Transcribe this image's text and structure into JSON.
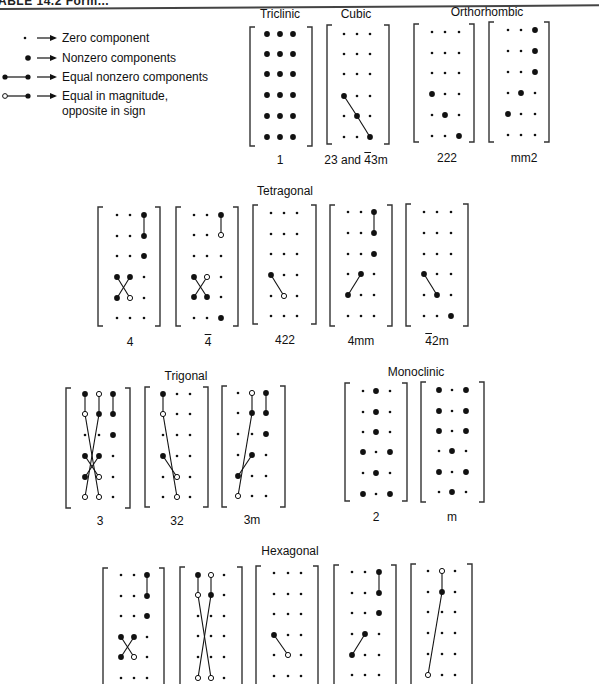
{
  "header": {
    "title": "ABLE 14.2 Form..."
  },
  "legend": [
    {
      "symbol": "zero-dot",
      "text": "Zero component"
    },
    {
      "symbol": "nonzero-dot",
      "text": "Nonzero components"
    },
    {
      "symbol": "equal-pair",
      "text": "Equal nonzero components"
    },
    {
      "symbol": "opposite-pair",
      "text": "Equal in magnitude,",
      "text2": "opposite in sign"
    }
  ],
  "groups": [
    {
      "name": "Triclinic",
      "x": 280,
      "y": 7
    },
    {
      "name": "Cubic",
      "x": 356,
      "y": 7
    },
    {
      "name": "Orthorhombic",
      "x": 487,
      "y": 5
    },
    {
      "name": "Tetragonal",
      "x": 285,
      "y": 184
    },
    {
      "name": "Trigonal",
      "x": 186,
      "y": 369
    },
    {
      "name": "Monoclinic",
      "x": 416,
      "y": 365
    },
    {
      "name": "Hexagonal",
      "x": 290,
      "y": 544
    }
  ],
  "matrices": [
    {
      "label": "1",
      "x": 250,
      "y": 27,
      "w": 62,
      "h": 119,
      "cols": [
        267,
        280,
        293
      ],
      "rows": [
        34,
        54,
        74,
        95,
        116,
        137
      ],
      "lx": 280,
      "ly": 153,
      "dots": [
        [
          "n",
          "n",
          "n"
        ],
        [
          "n",
          "n",
          "n"
        ],
        [
          "n",
          "n",
          "n"
        ],
        [
          "n",
          "n",
          "n"
        ],
        [
          "n",
          "n",
          "n"
        ],
        [
          "n",
          "n",
          "n"
        ]
      ],
      "lines": []
    },
    {
      "label": "23 and 43m",
      "label_bar_char": "4",
      "x": 327,
      "y": 25,
      "w": 62,
      "h": 119,
      "cols": [
        344,
        357,
        370
      ],
      "rows": [
        34,
        54,
        74,
        96,
        116,
        137
      ],
      "lx": 356,
      "ly": 153,
      "dots": [
        [
          "z",
          "z",
          "z"
        ],
        [
          "z",
          "z",
          "z"
        ],
        [
          "z",
          "z",
          "z"
        ],
        [
          "n",
          "z",
          "z"
        ],
        [
          "z",
          "n",
          "z"
        ],
        [
          "z",
          "z",
          "n"
        ]
      ],
      "lines": [
        [
          3,
          0,
          4,
          1
        ],
        [
          4,
          1,
          5,
          2
        ]
      ]
    },
    {
      "label": "222",
      "x": 414,
      "y": 24,
      "w": 60,
      "h": 118,
      "cols": [
        432,
        445,
        459
      ],
      "rows": [
        32,
        53,
        73,
        94,
        115,
        136
      ],
      "lx": 447,
      "ly": 151,
      "dots": [
        [
          "z",
          "z",
          "z"
        ],
        [
          "z",
          "z",
          "z"
        ],
        [
          "z",
          "z",
          "z"
        ],
        [
          "n",
          "z",
          "z"
        ],
        [
          "z",
          "n",
          "z"
        ],
        [
          "z",
          "z",
          "n"
        ]
      ],
      "lines": []
    },
    {
      "label": "mm2",
      "x": 489,
      "y": 22,
      "w": 60,
      "h": 120,
      "cols": [
        508,
        521,
        535
      ],
      "rows": [
        30,
        51,
        72,
        93,
        114,
        135
      ],
      "lx": 524,
      "ly": 151,
      "dots": [
        [
          "z",
          "z",
          "n"
        ],
        [
          "z",
          "z",
          "n"
        ],
        [
          "z",
          "z",
          "n"
        ],
        [
          "z",
          "n",
          "z"
        ],
        [
          "n",
          "z",
          "z"
        ],
        [
          "z",
          "z",
          "z"
        ]
      ],
      "lines": []
    },
    {
      "label": "4",
      "x": 98,
      "y": 207,
      "w": 62,
      "h": 119,
      "cols": [
        117,
        130,
        144
      ],
      "rows": [
        215,
        236,
        256,
        277,
        298,
        318
      ],
      "lx": 130,
      "ly": 335,
      "dots": [
        [
          "z",
          "z",
          "n"
        ],
        [
          "z",
          "z",
          "n"
        ],
        [
          "z",
          "z",
          "n"
        ],
        [
          "n",
          "n",
          "z"
        ],
        [
          "n",
          "o",
          "z"
        ],
        [
          "z",
          "z",
          "z"
        ]
      ],
      "lines": [
        [
          0,
          2,
          1,
          2
        ],
        [
          3,
          0,
          4,
          1
        ],
        [
          3,
          1,
          4,
          0
        ]
      ]
    },
    {
      "label": "4",
      "label_bar": true,
      "x": 176,
      "y": 207,
      "w": 62,
      "h": 119,
      "cols": [
        194,
        207,
        221
      ],
      "rows": [
        215,
        235,
        256,
        277,
        297,
        318
      ],
      "lx": 208,
      "ly": 335,
      "dots": [
        [
          "z",
          "z",
          "n"
        ],
        [
          "z",
          "z",
          "o"
        ],
        [
          "z",
          "z",
          "z"
        ],
        [
          "n",
          "o",
          "z"
        ],
        [
          "n",
          "n",
          "z"
        ],
        [
          "z",
          "z",
          "n"
        ]
      ],
      "lines": [
        [
          0,
          2,
          1,
          2
        ],
        [
          3,
          0,
          4,
          1
        ],
        [
          3,
          1,
          4,
          0
        ]
      ]
    },
    {
      "label": "422",
      "x": 253,
      "y": 205,
      "w": 63,
      "h": 119,
      "cols": [
        271,
        284,
        297
      ],
      "rows": [
        213,
        234,
        254,
        275,
        296,
        316
      ],
      "lx": 285,
      "ly": 333,
      "dots": [
        [
          "z",
          "z",
          "z"
        ],
        [
          "z",
          "z",
          "z"
        ],
        [
          "z",
          "z",
          "z"
        ],
        [
          "n",
          "z",
          "z"
        ],
        [
          "z",
          "o",
          "z"
        ],
        [
          "z",
          "z",
          "z"
        ]
      ],
      "lines": [
        [
          3,
          0,
          4,
          1
        ]
      ]
    },
    {
      "label": "4mm",
      "x": 330,
      "y": 205,
      "w": 62,
      "h": 121,
      "cols": [
        348,
        361,
        374
      ],
      "rows": [
        212,
        233,
        254,
        274,
        295,
        316
      ],
      "lx": 361,
      "ly": 334,
      "dots": [
        [
          "z",
          "z",
          "n"
        ],
        [
          "z",
          "z",
          "n"
        ],
        [
          "z",
          "z",
          "n"
        ],
        [
          "z",
          "n",
          "z"
        ],
        [
          "n",
          "z",
          "z"
        ],
        [
          "z",
          "z",
          "z"
        ]
      ],
      "lines": [
        [
          0,
          2,
          1,
          2
        ],
        [
          3,
          1,
          4,
          0
        ]
      ]
    },
    {
      "label": "42m",
      "label_bar_char": "4",
      "x": 406,
      "y": 204,
      "w": 62,
      "h": 122,
      "cols": [
        424,
        437,
        451
      ],
      "rows": [
        212,
        233,
        254,
        274,
        295,
        316
      ],
      "lx": 437,
      "ly": 334,
      "dots": [
        [
          "z",
          "z",
          "z"
        ],
        [
          "z",
          "z",
          "z"
        ],
        [
          "z",
          "z",
          "z"
        ],
        [
          "n",
          "z",
          "z"
        ],
        [
          "z",
          "n",
          "z"
        ],
        [
          "z",
          "z",
          "n"
        ]
      ],
      "lines": [
        [
          3,
          0,
          4,
          1
        ]
      ]
    },
    {
      "label": "3",
      "x": 66,
      "y": 388,
      "w": 64,
      "h": 120,
      "cols": [
        85,
        99,
        113
      ],
      "rows": [
        394,
        414,
        435,
        456,
        477,
        497
      ],
      "lx": 100,
      "ly": 514,
      "dots": [
        [
          "n",
          "o",
          "n"
        ],
        [
          "o",
          "n",
          "n"
        ],
        [
          "z",
          "z",
          "n"
        ],
        [
          "n",
          "n",
          "z"
        ],
        [
          "n",
          "o",
          "z"
        ],
        [
          "o",
          "o",
          "z"
        ]
      ],
      "lines": [
        [
          0,
          0,
          1,
          0
        ],
        [
          0,
          1,
          1,
          1
        ],
        [
          0,
          2,
          1,
          2
        ],
        [
          1,
          0,
          5,
          1
        ],
        [
          1,
          1,
          5,
          0
        ],
        [
          3,
          0,
          4,
          1
        ],
        [
          3,
          1,
          4,
          0
        ]
      ]
    },
    {
      "label": "32",
      "x": 145,
      "y": 387,
      "w": 63,
      "h": 120,
      "cols": [
        163,
        177,
        190
      ],
      "rows": [
        394,
        414,
        435,
        456,
        477,
        497
      ],
      "lx": 177,
      "ly": 514,
      "dots": [
        [
          "n",
          "z",
          "z"
        ],
        [
          "o",
          "z",
          "z"
        ],
        [
          "z",
          "z",
          "z"
        ],
        [
          "n",
          "z",
          "z"
        ],
        [
          "z",
          "o",
          "z"
        ],
        [
          "z",
          "o",
          "z"
        ]
      ],
      "lines": [
        [
          0,
          0,
          1,
          0
        ],
        [
          1,
          0,
          5,
          1
        ],
        [
          3,
          0,
          4,
          1
        ]
      ]
    },
    {
      "label": "3m",
      "x": 222,
      "y": 386,
      "w": 63,
      "h": 121,
      "cols": [
        238,
        252,
        266
      ],
      "rows": [
        393,
        413,
        434,
        455,
        476,
        496
      ],
      "lx": 252,
      "ly": 513,
      "dots": [
        [
          "z",
          "o",
          "n"
        ],
        [
          "z",
          "n",
          "n"
        ],
        [
          "z",
          "z",
          "n"
        ],
        [
          "z",
          "n",
          "z"
        ],
        [
          "n",
          "z",
          "z"
        ],
        [
          "o",
          "z",
          "z"
        ]
      ],
      "lines": [
        [
          0,
          1,
          1,
          1
        ],
        [
          0,
          2,
          1,
          2
        ],
        [
          1,
          1,
          5,
          0
        ],
        [
          3,
          1,
          4,
          0
        ]
      ]
    },
    {
      "label": "2",
      "x": 345,
      "y": 383,
      "w": 62,
      "h": 118,
      "cols": [
        363,
        376,
        390
      ],
      "rows": [
        391,
        412,
        432,
        452,
        473,
        494
      ],
      "lx": 376,
      "ly": 510,
      "dots": [
        [
          "z",
          "n",
          "z"
        ],
        [
          "z",
          "n",
          "z"
        ],
        [
          "z",
          "n",
          "z"
        ],
        [
          "n",
          "z",
          "n"
        ],
        [
          "z",
          "n",
          "z"
        ],
        [
          "n",
          "z",
          "n"
        ]
      ],
      "lines": []
    },
    {
      "label": "m",
      "x": 421,
      "y": 382,
      "w": 63,
      "h": 120,
      "cols": [
        439,
        452,
        466
      ],
      "rows": [
        390,
        411,
        431,
        451,
        472,
        492
      ],
      "lx": 452,
      "ly": 510,
      "dots": [
        [
          "n",
          "z",
          "n"
        ],
        [
          "n",
          "z",
          "n"
        ],
        [
          "n",
          "z",
          "n"
        ],
        [
          "z",
          "n",
          "z"
        ],
        [
          "n",
          "z",
          "n"
        ],
        [
          "z",
          "n",
          "z"
        ]
      ],
      "lines": []
    },
    {
      "label": "",
      "x": 103,
      "y": 568,
      "w": 61,
      "h": 120,
      "cols": [
        121,
        134,
        147
      ],
      "rows": [
        575,
        596,
        616,
        637,
        657,
        678
      ],
      "lx": 134,
      "ly": 690,
      "dots": [
        [
          "z",
          "z",
          "n"
        ],
        [
          "z",
          "z",
          "n"
        ],
        [
          "z",
          "z",
          "n"
        ],
        [
          "n",
          "n",
          "z"
        ],
        [
          "n",
          "o",
          "z"
        ],
        [
          "z",
          "z",
          "z"
        ]
      ],
      "lines": [
        [
          0,
          2,
          1,
          2
        ],
        [
          3,
          0,
          4,
          1
        ],
        [
          3,
          1,
          4,
          0
        ]
      ]
    },
    {
      "label": "",
      "x": 180,
      "y": 567,
      "w": 62,
      "h": 121,
      "cols": [
        198,
        211,
        224
      ],
      "rows": [
        575,
        595,
        616,
        636,
        657,
        678
      ],
      "lx": 211,
      "ly": 690,
      "dots": [
        [
          "n",
          "o",
          "z"
        ],
        [
          "o",
          "n",
          "z"
        ],
        [
          "z",
          "z",
          "z"
        ],
        [
          "z",
          "z",
          "z"
        ],
        [
          "z",
          "z",
          "z"
        ],
        [
          "o",
          "o",
          "z"
        ]
      ],
      "lines": [
        [
          0,
          0,
          1,
          0
        ],
        [
          0,
          1,
          1,
          1
        ],
        [
          1,
          0,
          5,
          1
        ],
        [
          1,
          1,
          5,
          0
        ]
      ]
    },
    {
      "label": "",
      "x": 256,
      "y": 566,
      "w": 62,
      "h": 121,
      "cols": [
        274,
        288,
        301
      ],
      "rows": [
        573,
        594,
        614,
        635,
        655,
        676
      ],
      "lx": 288,
      "ly": 690,
      "dots": [
        [
          "z",
          "z",
          "z"
        ],
        [
          "z",
          "z",
          "z"
        ],
        [
          "z",
          "z",
          "z"
        ],
        [
          "n",
          "z",
          "z"
        ],
        [
          "z",
          "o",
          "z"
        ],
        [
          "z",
          "z",
          "z"
        ]
      ],
      "lines": [
        [
          3,
          0,
          4,
          1
        ]
      ]
    },
    {
      "label": "",
      "x": 334,
      "y": 565,
      "w": 62,
      "h": 122,
      "cols": [
        352,
        365,
        379
      ],
      "rows": [
        572,
        593,
        613,
        634,
        655,
        675
      ],
      "lx": 365,
      "ly": 690,
      "dots": [
        [
          "z",
          "z",
          "n"
        ],
        [
          "z",
          "z",
          "n"
        ],
        [
          "z",
          "z",
          "n"
        ],
        [
          "z",
          "n",
          "z"
        ],
        [
          "n",
          "z",
          "z"
        ],
        [
          "z",
          "z",
          "z"
        ]
      ],
      "lines": [
        [
          0,
          2,
          1,
          2
        ],
        [
          3,
          1,
          4,
          0
        ]
      ]
    },
    {
      "label": "",
      "x": 411,
      "y": 564,
      "w": 61,
      "h": 122,
      "cols": [
        428,
        442,
        455
      ],
      "rows": [
        571,
        592,
        612,
        633,
        654,
        675
      ],
      "lx": 442,
      "ly": 690,
      "dots": [
        [
          "z",
          "o",
          "z"
        ],
        [
          "z",
          "n",
          "z"
        ],
        [
          "z",
          "z",
          "z"
        ],
        [
          "z",
          "z",
          "z"
        ],
        [
          "z",
          "z",
          "z"
        ],
        [
          "o",
          "z",
          "z"
        ]
      ],
      "lines": [
        [
          0,
          1,
          1,
          1
        ],
        [
          1,
          1,
          5,
          0
        ]
      ]
    }
  ],
  "colors": {
    "ink": "#111111",
    "paper": "#ffffff",
    "bracket": "#333333"
  }
}
